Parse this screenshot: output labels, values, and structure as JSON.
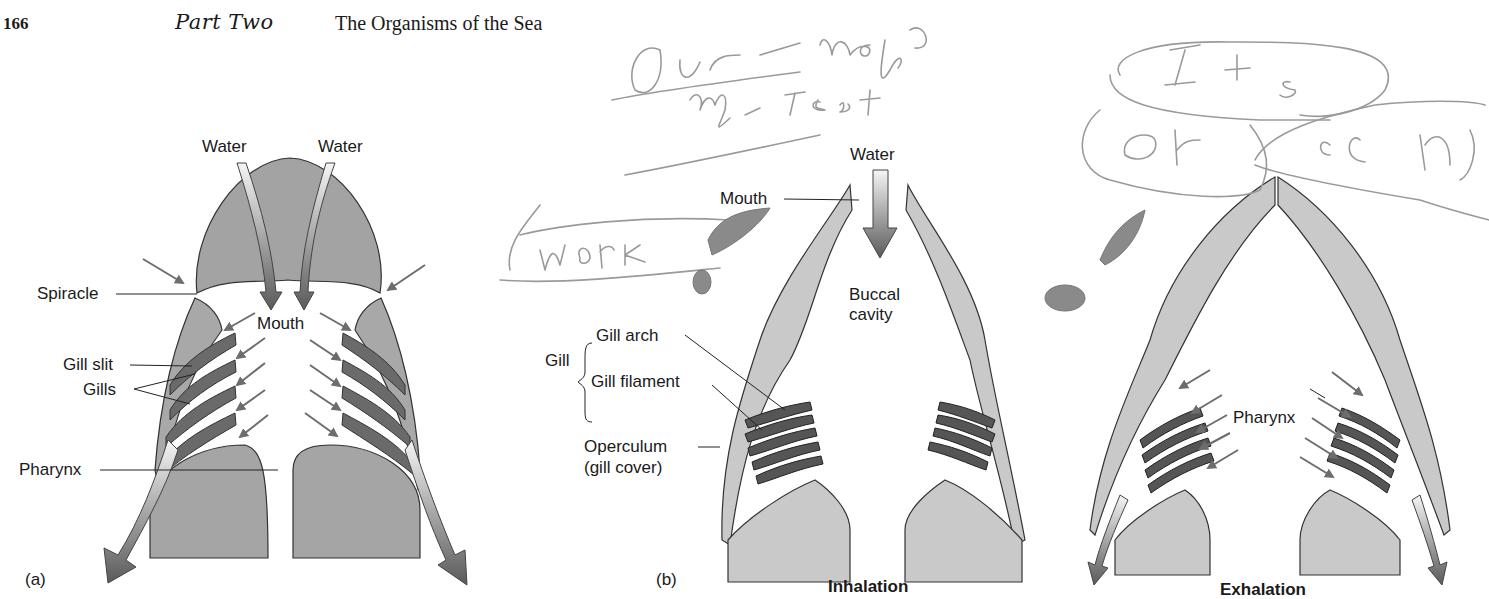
{
  "header": {
    "page_number": "166",
    "part": "Part Two",
    "chapter_title": "The Organisms of the Sea"
  },
  "panel_a": {
    "label": "(a)",
    "labels": {
      "water_left": "Water",
      "water_right": "Water",
      "spiracle": "Spiracle",
      "mouth": "Mouth",
      "gill_slit": "Gill slit",
      "gills": "Gills",
      "pharynx": "Pharynx"
    }
  },
  "panel_b": {
    "label": "(b)",
    "inhalation": {
      "caption": "Inhalation",
      "labels": {
        "water": "Water",
        "mouth": "Mouth",
        "buccal_line1": "Buccal",
        "buccal_line2": "cavity",
        "gill": "Gill",
        "gill_arch": "Gill arch",
        "gill_filament": "Gill filament",
        "operculum_line1": "Operculum",
        "operculum_line2": "(gill cover)"
      }
    },
    "exhalation": {
      "caption": "Exhalation",
      "labels": {
        "pharynx": "Pharynx"
      }
    }
  },
  "handwriting": {
    "line1": "Our - maple",
    "line2": "my - Test",
    "boxed_1": "I + s",
    "boxed_2": "Ok",
    "boxed_3": "ocn",
    "boxed_4": "Work"
  },
  "colors": {
    "tissue_dark": "#9e9e9e",
    "tissue_light": "#c9c9c9",
    "gill": "#6a6a6a",
    "arrow": "#6d6d6d",
    "pencil": "#9a9a9a"
  }
}
